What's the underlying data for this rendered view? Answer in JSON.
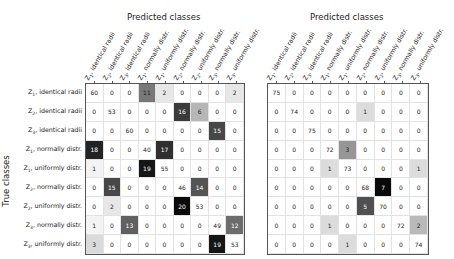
{
  "chart_data": [
    {
      "type": "heatmap",
      "title": "Predicted classes",
      "xlabel": "Predicted classes",
      "ylabel": "True classes",
      "categories": [
        "Z1, identical radii",
        "Z2, identical radii",
        "Z3, identical radii",
        "Z1, normally distr.",
        "Z1, uniformly distr.",
        "Z2, normally distr.",
        "Z2, uniformly distr.",
        "Z3, normally distr.",
        "Z3, uniformly distr."
      ],
      "matrix": [
        [
          60,
          0,
          0,
          11,
          2,
          0,
          0,
          0,
          2
        ],
        [
          0,
          53,
          0,
          0,
          0,
          16,
          6,
          0,
          0
        ],
        [
          0,
          0,
          60,
          0,
          0,
          0,
          0,
          15,
          0
        ],
        [
          18,
          0,
          0,
          40,
          17,
          0,
          0,
          0,
          0
        ],
        [
          1,
          0,
          0,
          19,
          55,
          0,
          0,
          0,
          0
        ],
        [
          0,
          15,
          0,
          0,
          0,
          46,
          14,
          0,
          0
        ],
        [
          0,
          2,
          0,
          0,
          0,
          20,
          53,
          0,
          0
        ],
        [
          1,
          0,
          13,
          0,
          0,
          0,
          0,
          49,
          12
        ],
        [
          3,
          0,
          0,
          0,
          0,
          0,
          0,
          19,
          53
        ]
      ]
    },
    {
      "type": "heatmap",
      "title": "Predicted classes",
      "xlabel": "Predicted classes",
      "ylabel": "",
      "categories": [
        "Z1, identical radii",
        "Z2, identical radii",
        "Z3, identical radii",
        "Z1, normally distr.",
        "Z1, uniformly distr.",
        "Z2, normally distr.",
        "Z2, uniformly distr.",
        "Z3, normally distr.",
        "Z3, uniformly distr."
      ],
      "matrix": [
        [
          75,
          0,
          0,
          0,
          0,
          0,
          0,
          0,
          0
        ],
        [
          0,
          74,
          0,
          0,
          0,
          1,
          0,
          0,
          0
        ],
        [
          0,
          0,
          75,
          0,
          0,
          0,
          0,
          0,
          0
        ],
        [
          0,
          0,
          0,
          72,
          3,
          0,
          0,
          0,
          0
        ],
        [
          0,
          0,
          0,
          1,
          73,
          0,
          0,
          0,
          1
        ],
        [
          0,
          0,
          0,
          0,
          0,
          68,
          7,
          0,
          0
        ],
        [
          0,
          0,
          0,
          0,
          0,
          5,
          70,
          0,
          0
        ],
        [
          0,
          0,
          0,
          1,
          0,
          0,
          0,
          72,
          2
        ],
        [
          0,
          0,
          0,
          0,
          1,
          0,
          0,
          0,
          74
        ]
      ]
    }
  ],
  "labels": {
    "left_title": "Predicted classes",
    "right_title": "Predicted classes",
    "ylabel": "True classes",
    "class_prefixes": [
      "Z",
      "Z",
      "Z",
      "Z",
      "Z",
      "Z",
      "Z",
      "Z",
      "Z"
    ],
    "class_subs": [
      "1",
      "2",
      "3",
      "1",
      "1",
      "2",
      "2",
      "3",
      "3"
    ],
    "class_suffixes": [
      ", identical radii",
      ", identical radii",
      ", identical radii",
      ", normally distr.",
      ", uniformly distr.",
      ", normally distr.",
      ", uniformly distr.",
      ", normally distr.",
      ", uniformly distr."
    ]
  }
}
